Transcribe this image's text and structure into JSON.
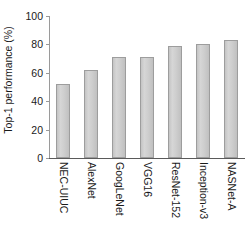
{
  "chart_data": {
    "type": "bar",
    "title": "",
    "xlabel": "",
    "ylabel": "Top-1 performance (%)",
    "categories": [
      "NEC-UIUC",
      "AlexNet",
      "GoogLeNet",
      "VGG16",
      "ResNet-152",
      "Inception-v3",
      "NASNet-A"
    ],
    "values": [
      52,
      62,
      71,
      71,
      79,
      80,
      83
    ],
    "ylim": [
      0,
      100
    ],
    "yticks": [
      0,
      20,
      40,
      60,
      80,
      100
    ],
    "ytick_labels": [
      "0",
      "20",
      "40",
      "60",
      "80",
      "100"
    ],
    "grid": false,
    "legend": null,
    "bar_fill_color": "#cfcfcf",
    "bar_edge_color": "#9d9d9d",
    "axis_color": "#5a5a5a",
    "text_color": "#1a1a1a"
  }
}
